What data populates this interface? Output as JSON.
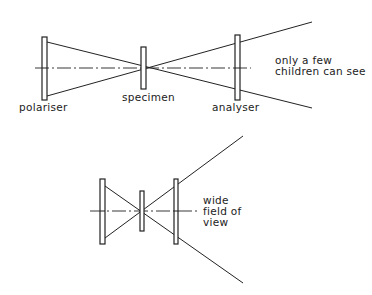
{
  "diagram": {
    "top": {
      "labels": {
        "polariser": "polariser",
        "specimen": "specimen",
        "analyser": "analyser",
        "note_line1": "only a few",
        "note_line2": "children can see"
      }
    },
    "bottom": {
      "labels": {
        "note_line1": "wide",
        "note_line2": "field of",
        "note_line3": "view"
      }
    }
  }
}
